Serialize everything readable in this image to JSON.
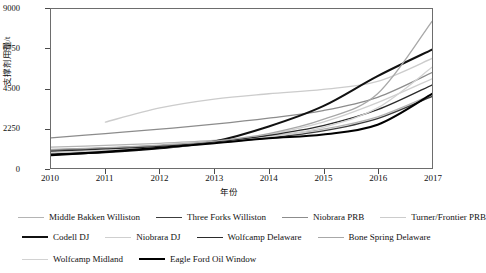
{
  "chart_data": {
    "type": "line",
    "title": "",
    "xlabel": "年份",
    "ylabel": "支撑剂用量/t",
    "xlim": [
      2010,
      2017
    ],
    "ylim": [
      0,
      9000
    ],
    "grid": false,
    "legend_position": "bottom",
    "xticks": [
      "2010",
      "2011",
      "2012",
      "2013",
      "2014",
      "2015",
      "2016",
      "2017"
    ],
    "yticks": [
      "0",
      "2250",
      "4500",
      "6750",
      "9000"
    ],
    "x": [
      2010,
      2011,
      2012,
      2013,
      2014,
      2015,
      2016,
      2017
    ],
    "series": [
      {
        "name": "Middle Bakken Williston",
        "color": "#b4b4b4",
        "width": 1.3,
        "x": [
          2010,
          2011,
          2012,
          2013,
          2014,
          2015,
          2016,
          2017
        ],
        "values": [
          1180,
          1280,
          1400,
          1560,
          1820,
          2200,
          2900,
          4150
        ]
      },
      {
        "name": "Three Forks Williston",
        "color": "#3c3c3c",
        "width": 1.3,
        "x": [
          2010,
          2011,
          2012,
          2013,
          2014,
          2015,
          2016,
          2017
        ],
        "values": [
          1020,
          1130,
          1260,
          1430,
          1700,
          2100,
          2800,
          4050
        ]
      },
      {
        "name": "Niobrara PRB",
        "color": "#8c8c8c",
        "width": 1.3,
        "x": [
          2010,
          2011,
          2012,
          2013,
          2014,
          2015,
          2016,
          2017
        ],
        "values": [
          1700,
          1950,
          2200,
          2480,
          2820,
          3250,
          4000,
          5400
        ]
      },
      {
        "name": "Turner/Frontier PRB",
        "color": "#cccccc",
        "width": 1.4,
        "x": [
          2011,
          2012,
          2013,
          2014,
          2015,
          2016,
          2017
        ],
        "values": [
          2600,
          3400,
          3900,
          4200,
          4450,
          4900,
          6200
        ]
      },
      {
        "name": "Codell DJ",
        "color": "#111111",
        "width": 2.1,
        "x": [
          2010,
          2011,
          2012,
          2013,
          2014,
          2015,
          2016,
          2017
        ],
        "values": [
          780,
          900,
          1120,
          1500,
          2350,
          3500,
          5200,
          6700
        ]
      },
      {
        "name": "Niobrara DJ",
        "color": "#cfcfcf",
        "width": 1.3,
        "x": [
          2010,
          2011,
          2012,
          2013,
          2014,
          2015,
          2016,
          2017
        ],
        "values": [
          900,
          1000,
          1200,
          1450,
          1900,
          2600,
          3700,
          5050
        ]
      },
      {
        "name": "Wolfcamp Delaware",
        "color": "#2b2b2b",
        "width": 1.3,
        "x": [
          2010,
          2011,
          2012,
          2013,
          2014,
          2015,
          2016,
          2017
        ],
        "values": [
          950,
          1080,
          1230,
          1480,
          1850,
          2400,
          3300,
          4700
        ]
      },
      {
        "name": "Bone Spring Delaware",
        "color": "#a8a8a8",
        "width": 1.3,
        "x": [
          2010,
          2011,
          2012,
          2013,
          2014,
          2015,
          2016,
          2017
        ],
        "values": [
          1050,
          1150,
          1300,
          1520,
          1950,
          2750,
          4200,
          8300
        ]
      },
      {
        "name": "Wolfcamp Midland",
        "color": "#d2d2d2",
        "width": 1.3,
        "x": [
          2010,
          2011,
          2012,
          2013,
          2014,
          2015,
          2016,
          2017
        ],
        "values": [
          870,
          980,
          1150,
          1400,
          1750,
          2300,
          3400,
          5700
        ]
      },
      {
        "name": "Eagle Ford Oil Window",
        "color": "#000000",
        "width": 2.1,
        "x": [
          2010,
          2011,
          2012,
          2013,
          2014,
          2015,
          2016,
          2017
        ],
        "values": [
          720,
          920,
          1150,
          1400,
          1680,
          1900,
          2450,
          4200
        ]
      }
    ]
  },
  "legend": {
    "rows": [
      [
        "Middle Bakken Williston",
        "Three Forks Williston",
        "Niobrara PRB",
        "Turner/Frontier PRB"
      ],
      [
        "Codell DJ",
        "Niobrara DJ",
        "Wolfcamp Delaware",
        "Bone Spring Delaware"
      ],
      [
        "Wolfcamp Midland",
        "Eagle Ford Oil Window"
      ]
    ]
  }
}
